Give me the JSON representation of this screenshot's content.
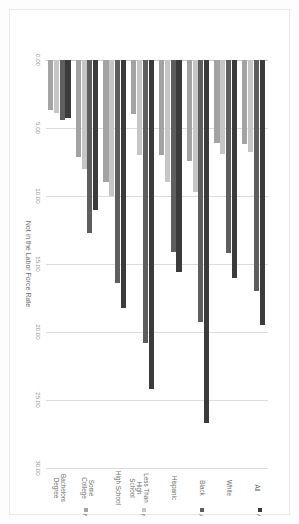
{
  "chart_data": {
    "type": "bar",
    "orientation": "horizontal",
    "title": "",
    "xlabel": "Not in the Labor Force Rate",
    "ylabel": "",
    "xlim": [
      0,
      30
    ],
    "xticks": [
      "0.00",
      "5.00",
      "10.00",
      "15.00",
      "20.00",
      "25.00",
      "30.00"
    ],
    "grid": true,
    "legend_position": "right",
    "categories": [
      "All",
      "White",
      "Black",
      "Hispanic",
      "Less Than High\nSchool",
      "High School",
      "Some College",
      "Bachelors Degree"
    ],
    "series": [
      {
        "name": "No Incarcerations or Arrests (2013)",
        "color": "#a3a3a3",
        "values": [
          6.2,
          6.1,
          7.4,
          7.0,
          4.0,
          9.0,
          7.1,
          3.7
        ]
      },
      {
        "name": "No Incarcerations (2013)",
        "color": "#c6c6c6",
        "values": [
          6.8,
          6.9,
          9.7,
          9.0,
          7.0,
          10.0,
          8.0,
          3.9
        ]
      },
      {
        "name": "At Least One Arrest (2013)",
        "color": "#5e5e5e",
        "values": [
          17.0,
          14.2,
          19.3,
          14.1,
          20.8,
          16.4,
          12.7,
          4.4
        ]
      },
      {
        "name": "At Least One Incarceration (2013)",
        "color": "#3b3b3b",
        "values": [
          19.5,
          16.0,
          26.7,
          15.6,
          24.2,
          18.2,
          11.0,
          4.3
        ]
      }
    ]
  },
  "legend": {
    "items": [
      {
        "label": "At Least One Incarceration (2013)",
        "color": "#3b3b3b"
      },
      {
        "label": "At Least One Arrest (2013)",
        "color": "#5e5e5e"
      },
      {
        "label": "No Incarcerations (2013)",
        "color": "#c6c6c6"
      },
      {
        "label": "No Incarcerations or Arrests (2013)",
        "color": "#a3a3a3"
      }
    ]
  }
}
